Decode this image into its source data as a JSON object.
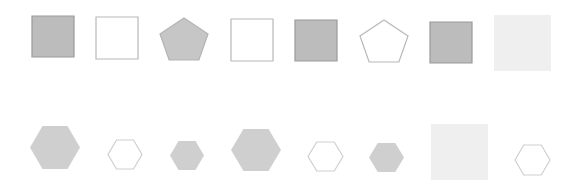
{
  "colors": {
    "background": "#ffffff",
    "dark_fill": "#bcbcbc",
    "dark_stroke": "#9a9a9a",
    "pentagon_fill": "#c6c6c6",
    "hex_fill": "#cfcfcf",
    "light_fill": "#efefef",
    "outline_stroke": "#b8b8b8",
    "hex_outline_stroke": "#cfcfcf"
  },
  "rows": [
    {
      "name": "top-row",
      "shapes": [
        {
          "type": "square",
          "style": "filled-dark",
          "x": 32,
          "y": 16,
          "w": 42,
          "h": 41
        },
        {
          "type": "square",
          "style": "outline",
          "x": 96,
          "y": 17,
          "w": 42,
          "h": 42
        },
        {
          "type": "pentagon",
          "style": "filled",
          "x": 160,
          "y": 18,
          "w": 48,
          "h": 42
        },
        {
          "type": "square",
          "style": "outline",
          "x": 231,
          "y": 19,
          "w": 42,
          "h": 42
        },
        {
          "type": "square",
          "style": "filled-dark",
          "x": 295,
          "y": 20,
          "w": 42,
          "h": 41
        },
        {
          "type": "pentagon",
          "style": "outline",
          "x": 360,
          "y": 20,
          "w": 48,
          "h": 42
        },
        {
          "type": "square",
          "style": "filled-dark",
          "x": 430,
          "y": 22,
          "w": 42,
          "h": 41
        },
        {
          "type": "square",
          "style": "filled-light",
          "x": 494,
          "y": 15,
          "w": 57,
          "h": 56
        }
      ]
    },
    {
      "name": "bottom-row",
      "shapes": [
        {
          "type": "hexagon",
          "style": "filled",
          "x": 30,
          "y": 126,
          "w": 50,
          "h": 43
        },
        {
          "type": "hexagon",
          "style": "outline",
          "x": 108,
          "y": 140,
          "w": 34,
          "h": 29
        },
        {
          "type": "hexagon",
          "style": "filled",
          "x": 170,
          "y": 141,
          "w": 34,
          "h": 29
        },
        {
          "type": "hexagon",
          "style": "filled",
          "x": 231,
          "y": 129,
          "w": 50,
          "h": 42
        },
        {
          "type": "hexagon",
          "style": "outline",
          "x": 308,
          "y": 142,
          "w": 35,
          "h": 29
        },
        {
          "type": "hexagon",
          "style": "filled",
          "x": 369,
          "y": 143,
          "w": 35,
          "h": 29
        },
        {
          "type": "square",
          "style": "filled-light",
          "x": 431,
          "y": 124,
          "w": 57,
          "h": 56
        },
        {
          "type": "hexagon",
          "style": "outline",
          "x": 515,
          "y": 145,
          "w": 35,
          "h": 30
        }
      ]
    }
  ]
}
